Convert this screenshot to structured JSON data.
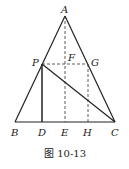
{
  "figure": {
    "caption": "图 10-13",
    "points": {
      "A": {
        "label": "A",
        "x": 65,
        "y": 16
      },
      "B": {
        "label": "B",
        "x": 15,
        "y": 122
      },
      "C": {
        "label": "C",
        "x": 115,
        "y": 122
      },
      "P": {
        "label": "P",
        "x": 42,
        "y": 64
      },
      "F": {
        "label": "F",
        "x": 65,
        "y": 64
      },
      "G": {
        "label": "G",
        "x": 88,
        "y": 64
      },
      "D": {
        "label": "D",
        "x": 42,
        "y": 122
      },
      "E": {
        "label": "E",
        "x": 65,
        "y": 122
      },
      "H": {
        "label": "H",
        "x": 88,
        "y": 122
      }
    },
    "solid_segments": [
      "AB",
      "AC",
      "BC",
      "PD",
      "PC"
    ],
    "dashed_segments": [
      "AE",
      "PG",
      "GH"
    ],
    "line_color": "#222222"
  }
}
